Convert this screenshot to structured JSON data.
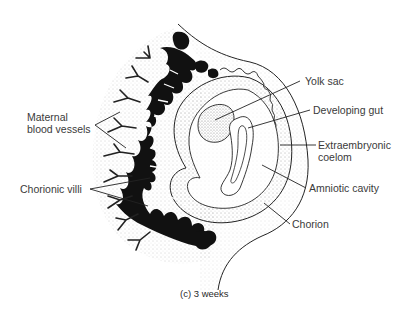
{
  "figure": {
    "caption": "(c) 3 weeks",
    "colors": {
      "ink": "#111111",
      "label_text": "#3a3a3a",
      "stipple": "#9a9a9a",
      "background": "#ffffff"
    }
  },
  "labels": {
    "left": [
      {
        "id": "maternal-blood-vessels",
        "line1": "Maternal",
        "line2": "blood vessels"
      },
      {
        "id": "chorionic-villi",
        "line1": "Chorionic villi"
      }
    ],
    "right": [
      {
        "id": "yolk-sac",
        "line1": "Yolk sac"
      },
      {
        "id": "developing-gut",
        "line1": "Developing gut"
      },
      {
        "id": "extraembryonic-coelom",
        "line1": "Extraembryonic",
        "line2": "coelom"
      },
      {
        "id": "amniotic-cavity",
        "line1": "Amniotic cavity"
      },
      {
        "id": "chorion",
        "line1": "Chorion"
      }
    ]
  }
}
